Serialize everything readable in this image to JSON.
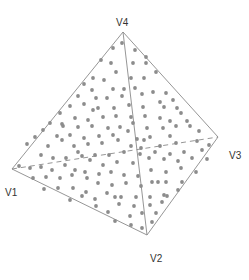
{
  "diagram": {
    "colors": {
      "background": "#ffffff",
      "edge": "#8a8a8a",
      "hidden_edge": "#8a8a8a",
      "point": "#8c8c8c",
      "label": "#333333"
    },
    "vertices": [
      {
        "id": "V1",
        "label": "V1",
        "x": 12,
        "y": 169,
        "label_x": 5,
        "label_y": 196
      },
      {
        "id": "V2",
        "label": "V2",
        "x": 147,
        "y": 235,
        "label_x": 150,
        "label_y": 262
      },
      {
        "id": "V3",
        "label": "V3",
        "x": 218,
        "y": 137,
        "label_x": 229,
        "label_y": 159
      },
      {
        "id": "V4",
        "label": "V4",
        "x": 123,
        "y": 32,
        "label_x": 116,
        "label_y": 26
      }
    ],
    "edges": [
      {
        "from": "V4",
        "to": "V1",
        "style": "solid"
      },
      {
        "from": "V4",
        "to": "V3",
        "style": "solid"
      },
      {
        "from": "V4",
        "to": "V2",
        "style": "solid"
      },
      {
        "from": "V1",
        "to": "V2",
        "style": "solid"
      },
      {
        "from": "V2",
        "to": "V3",
        "style": "solid"
      },
      {
        "from": "V1",
        "to": "V3",
        "style": "dashed"
      }
    ],
    "points": [
      [
        122,
        43
      ],
      [
        113,
        48
      ],
      [
        135,
        50
      ],
      [
        146,
        57
      ],
      [
        101,
        60
      ],
      [
        111,
        63
      ],
      [
        133,
        63
      ],
      [
        146,
        63
      ],
      [
        116,
        72
      ],
      [
        93,
        78
      ],
      [
        104,
        80
      ],
      [
        131,
        78
      ],
      [
        144,
        78
      ],
      [
        156,
        72
      ],
      [
        84,
        84
      ],
      [
        92,
        90
      ],
      [
        113,
        89
      ],
      [
        124,
        89
      ],
      [
        135,
        88
      ],
      [
        153,
        92
      ],
      [
        166,
        93
      ],
      [
        78,
        96
      ],
      [
        96,
        98
      ],
      [
        122,
        96
      ],
      [
        142,
        94
      ],
      [
        160,
        102
      ],
      [
        173,
        100
      ],
      [
        70,
        106
      ],
      [
        84,
        104
      ],
      [
        98,
        108
      ],
      [
        114,
        108
      ],
      [
        129,
        105
      ],
      [
        143,
        107
      ],
      [
        164,
        107
      ],
      [
        177,
        108
      ],
      [
        60,
        113
      ],
      [
        75,
        118
      ],
      [
        88,
        120
      ],
      [
        103,
        117
      ],
      [
        116,
        116
      ],
      [
        131,
        117
      ],
      [
        145,
        116
      ],
      [
        160,
        118
      ],
      [
        181,
        113
      ],
      [
        50,
        123
      ],
      [
        63,
        126
      ],
      [
        78,
        127
      ],
      [
        92,
        126
      ],
      [
        108,
        128
      ],
      [
        120,
        127
      ],
      [
        133,
        123
      ],
      [
        147,
        128
      ],
      [
        163,
        128
      ],
      [
        176,
        126
      ],
      [
        187,
        121
      ],
      [
        43,
        130
      ],
      [
        57,
        136
      ],
      [
        70,
        135
      ],
      [
        84,
        138
      ],
      [
        99,
        136
      ],
      [
        113,
        135
      ],
      [
        137,
        139
      ],
      [
        150,
        137
      ],
      [
        170,
        136
      ],
      [
        190,
        126
      ],
      [
        199,
        131
      ],
      [
        35,
        137
      ],
      [
        48,
        146
      ],
      [
        62,
        140
      ],
      [
        74,
        146
      ],
      [
        88,
        144
      ],
      [
        102,
        143
      ],
      [
        118,
        140
      ],
      [
        131,
        146
      ],
      [
        144,
        140
      ],
      [
        160,
        146
      ],
      [
        176,
        143
      ],
      [
        197,
        141
      ],
      [
        209,
        145
      ],
      [
        27,
        144
      ],
      [
        41,
        155
      ],
      [
        53,
        158
      ],
      [
        66,
        158
      ],
      [
        82,
        156
      ],
      [
        95,
        155
      ],
      [
        109,
        155
      ],
      [
        124,
        152
      ],
      [
        140,
        154
      ],
      [
        155,
        152
      ],
      [
        170,
        154
      ],
      [
        184,
        152
      ],
      [
        202,
        150
      ],
      [
        19,
        166
      ],
      [
        30,
        168
      ],
      [
        41,
        167
      ],
      [
        52,
        170
      ],
      [
        65,
        165
      ],
      [
        75,
        170
      ],
      [
        90,
        160
      ],
      [
        103,
        165
      ],
      [
        117,
        162
      ],
      [
        133,
        163
      ],
      [
        149,
        158
      ],
      [
        164,
        159
      ],
      [
        178,
        161
      ],
      [
        192,
        158
      ],
      [
        207,
        159
      ],
      [
        33,
        178
      ],
      [
        46,
        177
      ],
      [
        60,
        178
      ],
      [
        72,
        175
      ],
      [
        85,
        172
      ],
      [
        99,
        174
      ],
      [
        111,
        172
      ],
      [
        124,
        175
      ],
      [
        138,
        176
      ],
      [
        151,
        170
      ],
      [
        166,
        172
      ],
      [
        181,
        168
      ],
      [
        196,
        172
      ],
      [
        44,
        189
      ],
      [
        58,
        188
      ],
      [
        73,
        188
      ],
      [
        86,
        192
      ],
      [
        98,
        183
      ],
      [
        112,
        185
      ],
      [
        126,
        183
      ],
      [
        141,
        186
      ],
      [
        152,
        182
      ],
      [
        166,
        182
      ],
      [
        182,
        182
      ],
      [
        70,
        200
      ],
      [
        82,
        196
      ],
      [
        95,
        199
      ],
      [
        107,
        193
      ],
      [
        121,
        197
      ],
      [
        136,
        197
      ],
      [
        150,
        197
      ],
      [
        164,
        195
      ],
      [
        178,
        190
      ],
      [
        96,
        206
      ],
      [
        108,
        212
      ],
      [
        119,
        204
      ],
      [
        134,
        206
      ],
      [
        150,
        205
      ],
      [
        162,
        202
      ],
      [
        167,
        196
      ],
      [
        115,
        221
      ],
      [
        130,
        216
      ],
      [
        142,
        213
      ],
      [
        156,
        213
      ],
      [
        131,
        225
      ],
      [
        142,
        228
      ],
      [
        152,
        222
      ],
      [
        115,
        197
      ],
      [
        87,
        178
      ],
      [
        78,
        152
      ],
      [
        62,
        124
      ],
      [
        107,
        98
      ],
      [
        128,
        131
      ],
      [
        141,
        148
      ],
      [
        170,
        121
      ],
      [
        158,
        182
      ],
      [
        93,
        110
      ]
    ]
  }
}
